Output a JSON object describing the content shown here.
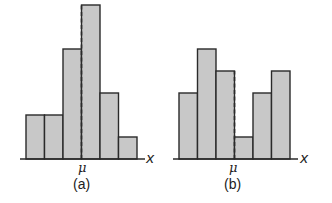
{
  "chart_data": [
    {
      "type": "bar",
      "title": "(a)",
      "xlabel": "x",
      "ylabel": "",
      "mean_label": "μ",
      "mean_position_after_bar": 3,
      "categories": [
        "1",
        "2",
        "3",
        "4",
        "5",
        "6"
      ],
      "values": [
        2,
        2,
        5,
        7,
        3,
        1
      ],
      "grid": false,
      "legend": "none",
      "style": {
        "bar_fill": "#c8c8c8",
        "bar_stroke": "#2a2a2a",
        "mean_line": "dashed"
      }
    },
    {
      "type": "bar",
      "title": "(b)",
      "xlabel": "x",
      "ylabel": "",
      "mean_label": "μ",
      "mean_position_after_bar": 3,
      "categories": [
        "1",
        "2",
        "3",
        "4",
        "5",
        "6"
      ],
      "values": [
        3,
        5,
        4,
        1,
        3,
        4
      ],
      "grid": false,
      "legend": "none",
      "style": {
        "bar_fill": "#c8c8c8",
        "bar_stroke": "#2a2a2a",
        "mean_line": "dashed"
      }
    }
  ],
  "panels": {
    "a": {
      "caption": "(a)",
      "mean_label": "μ",
      "x_label": "x"
    },
    "b": {
      "caption": "(b)",
      "mean_label": "μ",
      "x_label": "x"
    }
  }
}
